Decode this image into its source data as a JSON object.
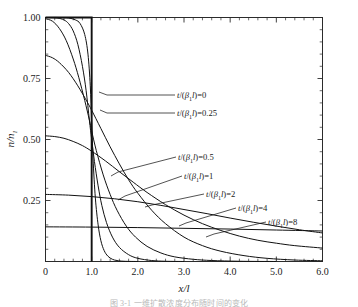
{
  "chart_data": {
    "type": "line",
    "title": "",
    "xlabel": "x/l",
    "ylabel": "n/n1",
    "ylabel_parts": {
      "num": "n",
      "den": "n",
      "den_sub": "1"
    },
    "xlim": [
      0,
      6.0
    ],
    "ylim": [
      0,
      1.0
    ],
    "grid": false,
    "legend": "inline-annotations",
    "x_ticks": [
      "0",
      "1.0",
      "2.0",
      "3.0",
      "4.0",
      "5.0",
      "6.0"
    ],
    "x_tick_values": [
      0,
      1.0,
      2.0,
      3.0,
      4.0,
      5.0,
      6.0
    ],
    "x_minor_per_major": 5,
    "y_ticks": [
      "0.25",
      "0.50",
      "0.75",
      "1.00"
    ],
    "y_tick_values": [
      0.25,
      0.5,
      0.75,
      1.0
    ],
    "y_minor_per_major": 5,
    "annotations": [
      {
        "text_prefix": "t",
        "text_mid": "/(",
        "beta": "β",
        "sub": "1",
        "ell": "l",
        "text_suffix": ")=",
        "value": "0"
      },
      {
        "text_prefix": "t",
        "text_mid": "/(",
        "beta": "β",
        "sub": "1",
        "ell": "l",
        "text_suffix": ")=",
        "value": "0.25"
      },
      {
        "text_prefix": "t",
        "text_mid": "/(",
        "beta": "β",
        "sub": "1",
        "ell": "l",
        "text_suffix": ")=",
        "value": "0.5"
      },
      {
        "text_prefix": "t",
        "text_mid": "/(",
        "beta": "β",
        "sub": "1",
        "ell": "l",
        "text_suffix": ")=",
        "value": "1"
      },
      {
        "text_prefix": "t",
        "text_mid": "/(",
        "beta": "β",
        "sub": "1",
        "ell": "l",
        "text_suffix": ")=",
        "value": "2"
      },
      {
        "text_prefix": "t",
        "text_mid": "/(",
        "beta": "β",
        "sub": "1",
        "ell": "l",
        "text_suffix": ")=",
        "value": "4"
      },
      {
        "text_prefix": "t",
        "text_mid": "/(",
        "beta": "β",
        "sub": "1",
        "ell": "l",
        "text_suffix": ")=",
        "value": "8"
      }
    ],
    "series": [
      {
        "name": "t/(β1l)=0",
        "label": "t/(β1l)=0",
        "style": "step",
        "points": [
          [
            0,
            1.0
          ],
          [
            1.0,
            1.0
          ],
          [
            1.0,
            0.0
          ]
        ]
      },
      {
        "name": "t/(β1l)=0.25",
        "label": "t/(β1l)=0.25",
        "style": "line",
        "points": [
          [
            0,
            1.0
          ],
          [
            0.3,
            1.0
          ],
          [
            0.5,
            0.998
          ],
          [
            0.65,
            0.99
          ],
          [
            0.75,
            0.975
          ],
          [
            0.85,
            0.93
          ],
          [
            0.92,
            0.85
          ],
          [
            0.97,
            0.72
          ],
          [
            1.0,
            0.57
          ],
          [
            1.03,
            0.42
          ],
          [
            1.08,
            0.26
          ],
          [
            1.14,
            0.15
          ],
          [
            1.2,
            0.085
          ],
          [
            1.27,
            0.045
          ],
          [
            1.35,
            0.022
          ],
          [
            1.45,
            0.009
          ],
          [
            1.55,
            0.004
          ],
          [
            1.7,
            0.001
          ],
          [
            2.0,
            0.0
          ]
        ]
      },
      {
        "name": "t/(β1l)=0.5",
        "label": "t/(β1l)=0.5",
        "style": "line",
        "points": [
          [
            0,
            1.0
          ],
          [
            0.25,
            0.998
          ],
          [
            0.4,
            0.99
          ],
          [
            0.5,
            0.975
          ],
          [
            0.6,
            0.945
          ],
          [
            0.7,
            0.89
          ],
          [
            0.8,
            0.8
          ],
          [
            0.88,
            0.7
          ],
          [
            0.95,
            0.58
          ],
          [
            1.0,
            0.5
          ],
          [
            1.06,
            0.41
          ],
          [
            1.14,
            0.31
          ],
          [
            1.22,
            0.23
          ],
          [
            1.32,
            0.16
          ],
          [
            1.45,
            0.1
          ],
          [
            1.6,
            0.058
          ],
          [
            1.8,
            0.028
          ],
          [
            2.0,
            0.013
          ],
          [
            2.3,
            0.004
          ],
          [
            2.6,
            0.001
          ],
          [
            3.0,
            0.0
          ]
        ]
      },
      {
        "name": "t/(β1l)=1",
        "label": "t/(β1l)=1",
        "style": "line",
        "points": [
          [
            0,
            0.995
          ],
          [
            0.15,
            0.985
          ],
          [
            0.3,
            0.955
          ],
          [
            0.45,
            0.905
          ],
          [
            0.6,
            0.83
          ],
          [
            0.72,
            0.755
          ],
          [
            0.85,
            0.66
          ],
          [
            0.95,
            0.58
          ],
          [
            1.0,
            0.535
          ],
          [
            1.1,
            0.455
          ],
          [
            1.25,
            0.355
          ],
          [
            1.4,
            0.275
          ],
          [
            1.55,
            0.21
          ],
          [
            1.75,
            0.145
          ],
          [
            1.95,
            0.1
          ],
          [
            2.2,
            0.062
          ],
          [
            2.5,
            0.035
          ],
          [
            2.8,
            0.019
          ],
          [
            3.2,
            0.009
          ],
          [
            3.6,
            0.004
          ],
          [
            4.2,
            0.001
          ],
          [
            5.0,
            0.0
          ]
        ]
      },
      {
        "name": "t/(β1l)=2",
        "label": "t/(β1l)=2",
        "style": "line",
        "points": [
          [
            0,
            0.845
          ],
          [
            0.15,
            0.835
          ],
          [
            0.3,
            0.815
          ],
          [
            0.5,
            0.775
          ],
          [
            0.7,
            0.72
          ],
          [
            0.9,
            0.655
          ],
          [
            1.0,
            0.62
          ],
          [
            1.2,
            0.545
          ],
          [
            1.4,
            0.47
          ],
          [
            1.6,
            0.4
          ],
          [
            1.8,
            0.335
          ],
          [
            2.0,
            0.28
          ],
          [
            2.3,
            0.21
          ],
          [
            2.6,
            0.155
          ],
          [
            3.0,
            0.1
          ],
          [
            3.4,
            0.065
          ],
          [
            3.8,
            0.042
          ],
          [
            4.3,
            0.024
          ],
          [
            4.8,
            0.013
          ],
          [
            5.4,
            0.006
          ],
          [
            6.0,
            0.003
          ]
        ]
      },
      {
        "name": "t/(β1l)=4",
        "label": "t/(β1l)=4",
        "style": "line",
        "points": [
          [
            0,
            0.515
          ],
          [
            0.2,
            0.512
          ],
          [
            0.4,
            0.505
          ],
          [
            0.6,
            0.492
          ],
          [
            0.8,
            0.475
          ],
          [
            1.0,
            0.452
          ],
          [
            1.3,
            0.412
          ],
          [
            1.6,
            0.368
          ],
          [
            1.9,
            0.325
          ],
          [
            2.2,
            0.283
          ],
          [
            2.6,
            0.233
          ],
          [
            3.0,
            0.19
          ],
          [
            3.4,
            0.155
          ],
          [
            3.8,
            0.127
          ],
          [
            4.2,
            0.104
          ],
          [
            4.6,
            0.087
          ],
          [
            5.0,
            0.075
          ],
          [
            5.4,
            0.065
          ],
          [
            6.0,
            0.055
          ]
        ]
      },
      {
        "name": "t/(β1l)=8",
        "label": "t/(β1l)=8",
        "style": "line",
        "points": [
          [
            0,
            0.275
          ],
          [
            0.5,
            0.272
          ],
          [
            1.0,
            0.266
          ],
          [
            1.5,
            0.257
          ],
          [
            2.0,
            0.245
          ],
          [
            2.5,
            0.23
          ],
          [
            3.0,
            0.213
          ],
          [
            3.5,
            0.196
          ],
          [
            4.0,
            0.178
          ],
          [
            4.5,
            0.161
          ],
          [
            5.0,
            0.145
          ],
          [
            5.5,
            0.13
          ],
          [
            6.0,
            0.117
          ]
        ]
      },
      {
        "name": "asymptote",
        "label": "",
        "style": "line",
        "points": [
          [
            0,
            0.142
          ],
          [
            1.0,
            0.141
          ],
          [
            2.0,
            0.139
          ],
          [
            3.0,
            0.136
          ],
          [
            4.0,
            0.133
          ],
          [
            5.0,
            0.129
          ],
          [
            6.0,
            0.125
          ]
        ]
      }
    ]
  },
  "caption": {
    "text": "图 3-1   一维扩散浓度分布随时间的变化"
  },
  "colors": {
    "axis": "#2b2b2b",
    "curve": "#111111",
    "text": "#1a1a1a",
    "caption": "#b9b9b9",
    "background": "#ffffff"
  }
}
